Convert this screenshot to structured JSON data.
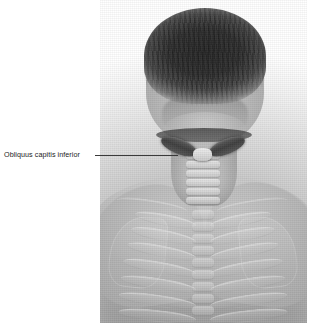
{
  "figure": {
    "name": "suboccipital-region-posterior-view",
    "photo_alt": "Grayscale posterior photograph of a man's head, neck and upper back with ghosted skeletal and muscular overlay",
    "background_color": "#ffffff",
    "plate_tone": "#b4b4b4"
  },
  "annotations": [
    {
      "label": "Obliquus capitis inferior",
      "leader_color": "#3a3a3a",
      "text_color": "#1c1c1c"
    }
  ],
  "overlay": {
    "highlighted_structure": "Obliquus capitis inferior",
    "highlight_color": "#3f3f3f",
    "bone_tint": "#ededed",
    "cervical_vertebrae_count": 6,
    "thoracic_vertebrae_count": 9,
    "rib_pairs": 7
  }
}
